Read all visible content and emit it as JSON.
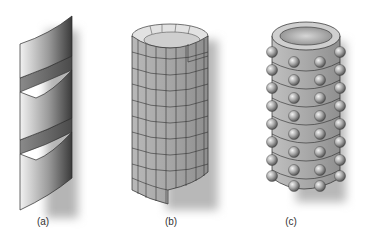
{
  "figure": {
    "panels": [
      {
        "id": "a",
        "label": "(a)",
        "description": "helical ribbon"
      },
      {
        "id": "b",
        "label": "(b)",
        "description": "gridded scroll cylinder"
      },
      {
        "id": "c",
        "label": "(c)",
        "description": "cylinder with spherical beads"
      }
    ],
    "colors": {
      "surface_dark": "#5a5a5a",
      "surface_light": "#d8d8d8",
      "outline": "#2a2a2a",
      "shadow": "#bdbdbd",
      "background": "#ffffff"
    }
  }
}
